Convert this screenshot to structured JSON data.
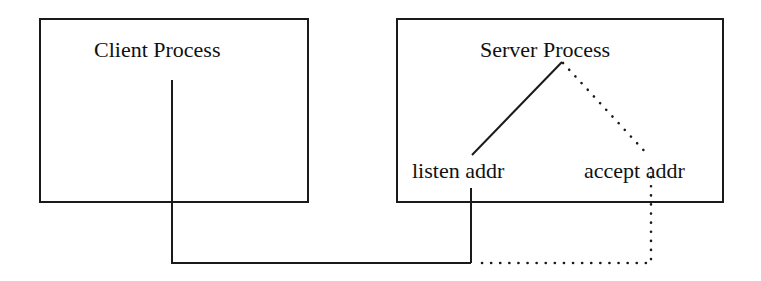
{
  "diagram": {
    "type": "process-connection-diagram",
    "nodes": [
      {
        "id": "client",
        "label": "Client Process"
      },
      {
        "id": "server",
        "label": "Server Process"
      },
      {
        "id": "listen",
        "label": "listen addr",
        "parent": "server"
      },
      {
        "id": "accept",
        "label": "accept addr",
        "parent": "server"
      }
    ],
    "edges": [
      {
        "from": "client",
        "to": "listen",
        "style": "solid"
      },
      {
        "from": "server",
        "to": "listen",
        "style": "solid"
      },
      {
        "from": "server",
        "to": "accept",
        "style": "dotted"
      },
      {
        "from": "accept",
        "to": "client-connection",
        "style": "dotted"
      }
    ],
    "colors": {
      "line": "#1a1a1a",
      "background": "#ffffff"
    }
  },
  "client": {
    "title": "Client Process"
  },
  "server": {
    "title": "Server Process",
    "listen_label": "listen addr",
    "accept_label": "accept addr"
  }
}
